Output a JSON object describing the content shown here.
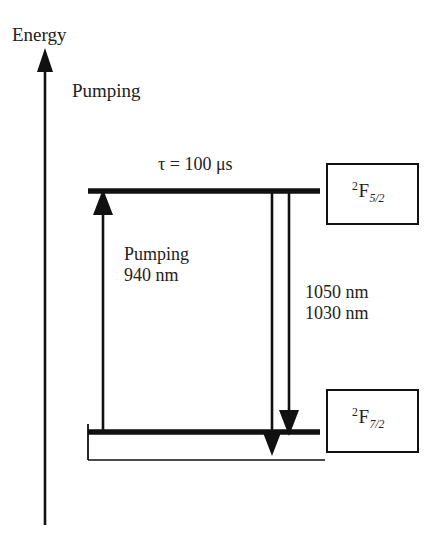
{
  "figure": {
    "type": "energy-level-diagram",
    "title_axis": "Energy",
    "background_color": "#ffffff",
    "line_color": "#111111"
  },
  "axis": {
    "label": "Energy",
    "direction": "up",
    "x": 45,
    "y_top": 55,
    "y_bottom": 525
  },
  "labels": {
    "pumping_top": "Pumping",
    "lifetime": "τ = 100 μs",
    "pump_caption_line1": "Pumping",
    "pump_caption_line2": "940 nm",
    "emission_line1": "1050 nm",
    "emission_line2": "1030 nm"
  },
  "levels": [
    {
      "name": "upper-level",
      "term_superscript": "2",
      "term_symbol": "F",
      "term_subscript": "5/2",
      "y": 191,
      "x_start": 88,
      "x_end": 320
    },
    {
      "name": "lower-level",
      "term_superscript": "2",
      "term_symbol": "F",
      "term_subscript": "7/2",
      "y": 432,
      "x_start": 88,
      "x_end": 320
    }
  ],
  "ground_baseline": {
    "y": 460,
    "x_start": 88,
    "x_end": 325
  },
  "transitions": [
    {
      "name": "pump-arrow",
      "direction": "up",
      "x": 103,
      "y_from": 432,
      "y_to": 193,
      "wavelength": "940 nm",
      "kind": "absorption"
    },
    {
      "name": "emission-arrow-1050",
      "direction": "down",
      "x": 272,
      "y_from": 193,
      "y_to": 452,
      "wavelength": "1050 nm",
      "kind": "emission"
    },
    {
      "name": "emission-arrow-1030",
      "direction": "down",
      "x": 289,
      "y_from": 193,
      "y_to": 434,
      "wavelength": "1030 nm",
      "kind": "emission"
    }
  ]
}
